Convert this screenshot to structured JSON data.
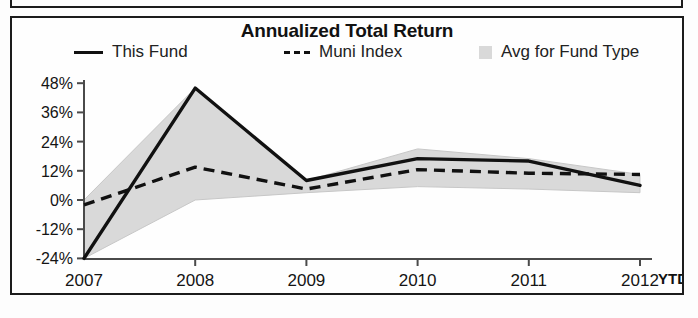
{
  "chart_data": {
    "type": "area",
    "title": "Annualized Total Return",
    "xlabel": "",
    "ylabel": "",
    "x_note": "YTD",
    "categories": [
      "2007",
      "2008",
      "2009",
      "2010",
      "2011",
      "2012"
    ],
    "ytick_labels": [
      "48%",
      "36%",
      "24%",
      "12%",
      "0%",
      "-12%",
      "-24%"
    ],
    "ytick_values": [
      48,
      36,
      24,
      12,
      0,
      -12,
      -24
    ],
    "ylim": [
      -24,
      52
    ],
    "grid": false,
    "legend_position": "top",
    "legend": [
      "This Fund",
      "Muni Index",
      "Avg for Fund Type"
    ],
    "series": [
      {
        "name": "This Fund",
        "style": "solid",
        "color": "#111111",
        "values": [
          -24,
          46,
          8,
          17,
          16,
          6
        ]
      },
      {
        "name": "Muni Index",
        "style": "dashed",
        "color": "#111111",
        "values": [
          -2,
          13.5,
          4.5,
          12.5,
          11,
          10.5
        ]
      },
      {
        "name": "Avg for Fund Type",
        "style": "area",
        "color": "#d9d9d9",
        "upper": [
          0,
          46,
          8,
          21,
          17,
          10.5
        ],
        "lower": [
          -24,
          0,
          3,
          5.5,
          4.5,
          3
        ]
      }
    ]
  },
  "chart": {
    "title": "Annualized Total Return",
    "legend_items": [
      {
        "label": "This Fund",
        "marker": "solid-line-swatch"
      },
      {
        "label": "Muni Index",
        "marker": "dashed-line-swatch"
      },
      {
        "label": "Avg for Fund Type",
        "marker": "area-square-swatch"
      }
    ],
    "ytd_label": "YTD"
  },
  "colors": {
    "line": "#111111",
    "area_fill": "#d9d9d9",
    "axis": "#4a4a4a",
    "frame": "#1c1c1c",
    "background": "#fefefe"
  }
}
